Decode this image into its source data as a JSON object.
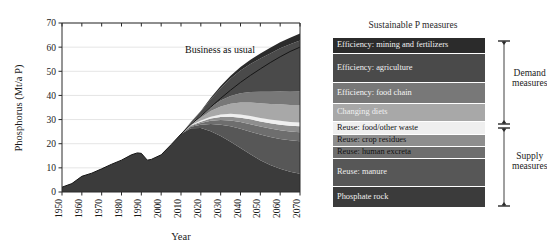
{
  "chart_data": {
    "type": "area",
    "title": "",
    "xlabel": "Year",
    "ylabel": "Phosphorus (Mt/a P)",
    "xlim": [
      1950,
      2070
    ],
    "ylim": [
      0,
      70
    ],
    "xticks": [
      1950,
      1960,
      1970,
      1980,
      1990,
      2000,
      2010,
      2020,
      2030,
      2040,
      2050,
      2060,
      2070
    ],
    "yticks": [
      0,
      10,
      20,
      30,
      40,
      50,
      60,
      70
    ],
    "grid": true,
    "legend_position": "right",
    "annotations": [
      {
        "text": "Business as usual",
        "x": 2022,
        "y": 52
      }
    ],
    "x": [
      1950,
      1955,
      1960,
      1965,
      1970,
      1975,
      1980,
      1985,
      1988,
      1990,
      1993,
      1995,
      2000,
      2005,
      2010,
      2015,
      2020,
      2025,
      2030,
      2035,
      2040,
      2045,
      2050,
      2055,
      2060,
      2065,
      2070
    ],
    "total_business_as_usual": [
      2.0,
      3.5,
      6.5,
      7.8,
      9.6,
      11.5,
      13.2,
      15.4,
      16.2,
      16.0,
      13.2,
      13.5,
      15.4,
      19.6,
      24.0,
      28.0,
      31.5,
      35.2,
      38.8,
      42.2,
      45.4,
      48.3,
      51.0,
      53.6,
      56.0,
      58.2,
      60.0
    ],
    "series": [
      {
        "name": "Phosphate rock",
        "color": "#3b3b3b",
        "values": [
          2.0,
          3.5,
          6.5,
          7.8,
          9.6,
          11.5,
          13.2,
          15.4,
          16.2,
          16.0,
          13.2,
          13.5,
          15.4,
          19.6,
          24.0,
          26.4,
          26.5,
          25.2,
          23.2,
          20.8,
          18.2,
          15.6,
          13.2,
          11.2,
          9.6,
          8.4,
          7.6
        ]
      },
      {
        "name": "Reuse: manure",
        "color": "#575757",
        "values": [
          0,
          0,
          0,
          0,
          0,
          0,
          0,
          0,
          0,
          0,
          0,
          0,
          0,
          0,
          0,
          0.6,
          1.4,
          3.0,
          4.7,
          6.4,
          8.0,
          9.4,
          10.6,
          11.6,
          12.4,
          13.0,
          13.4
        ]
      },
      {
        "name": "Reuse: human excreta",
        "color": "#6e6e6e",
        "values": [
          0,
          0,
          0,
          0,
          0,
          0,
          0,
          0,
          0,
          0,
          0,
          0,
          0,
          0,
          0,
          0.3,
          0.7,
          1.3,
          1.9,
          2.4,
          2.8,
          3.1,
          3.3,
          3.5,
          3.6,
          3.7,
          3.8
        ]
      },
      {
        "name": "Reuse: crop residues",
        "color": "#8e8e8e",
        "values": [
          0,
          0,
          0,
          0,
          0,
          0,
          0,
          0,
          0,
          0,
          0,
          0,
          0,
          0,
          0,
          0.2,
          0.5,
          0.9,
          1.3,
          1.6,
          1.8,
          2.0,
          2.1,
          2.2,
          2.3,
          2.3,
          2.4
        ]
      },
      {
        "name": "Reuse: food/other waste",
        "color": "#efefef",
        "values": [
          0,
          0,
          0,
          0,
          0,
          0,
          0,
          0,
          0,
          0,
          0,
          0,
          0,
          0,
          0,
          0.2,
          0.5,
          0.8,
          1.0,
          1.2,
          1.3,
          1.4,
          1.5,
          1.5,
          1.6,
          1.6,
          1.6
        ]
      },
      {
        "name": "Changing diets",
        "color": "#a8a8a8",
        "values": [
          0,
          0,
          0,
          0,
          0,
          0,
          0,
          0,
          0,
          0,
          0,
          0,
          0,
          0,
          0,
          0.4,
          1.2,
          2.3,
          3.3,
          4.2,
          5.0,
          5.6,
          6.1,
          6.5,
          6.8,
          7.0,
          7.2
        ]
      },
      {
        "name": "Efficiency: food chain",
        "color": "#787878",
        "values": [
          0,
          0,
          0,
          0,
          0,
          0,
          0,
          0,
          0,
          0,
          0,
          0,
          0,
          0,
          0,
          0.3,
          0.9,
          1.7,
          2.5,
          3.2,
          3.8,
          4.3,
          4.7,
          5.0,
          5.3,
          5.5,
          5.6
        ]
      },
      {
        "name": "Efficiency: agriculture",
        "color": "#4a4a4a",
        "values": [
          0,
          0,
          0,
          0,
          0,
          0,
          0,
          0,
          0,
          0,
          0,
          0,
          0,
          0,
          0,
          0.5,
          1.6,
          3.2,
          5.1,
          7.2,
          9.4,
          11.6,
          13.8,
          15.9,
          17.9,
          19.7,
          21.2
        ]
      },
      {
        "name": "Efficiency: mining and fertilizers",
        "color": "#2b2b2b",
        "values": [
          0,
          0,
          0,
          0,
          0,
          0,
          0,
          0,
          0,
          0,
          0,
          0,
          0,
          0,
          0,
          0.1,
          0.3,
          0.6,
          0.9,
          1.2,
          1.5,
          1.8,
          2.1,
          2.3,
          2.5,
          2.7,
          2.8
        ]
      }
    ]
  },
  "legend": {
    "title": "Sustainable P measures",
    "bands": [
      {
        "label": "Efficiency: mining and fertilizers",
        "color": "#2b2b2b",
        "text_color": "#f2f2f2",
        "height": 15
      },
      {
        "label": "Efficiency: agriculture",
        "color": "#4a4a4a",
        "text_color": "#f2f2f2",
        "height": 28
      },
      {
        "label": "Efficiency: food chain",
        "color": "#787878",
        "text_color": "#f7f7f7",
        "height": 20
      },
      {
        "label": "Changing diets",
        "color": "#a8a8a8",
        "text_color": "#f0f0f0",
        "height": 17
      },
      {
        "label": "Reuse: food/other waste",
        "color": "#efefef",
        "text_color": "#111111",
        "height": 12
      },
      {
        "label": "Reuse: crop residues",
        "color": "#8e8e8e",
        "text_color": "#111111",
        "height": 11
      },
      {
        "label": "Reuse: human excreta",
        "color": "#6e6e6e",
        "text_color": "#111111",
        "height": 11
      },
      {
        "label": "Reuse: manure",
        "color": "#575757",
        "text_color": "#eeeeee",
        "height": 27
      },
      {
        "label": "Phosphate rock",
        "color": "#3b3b3b",
        "text_color": "#f0f0f0",
        "height": 20
      }
    ]
  },
  "brackets": [
    {
      "label_line1": "Demand",
      "label_line2": "measures"
    },
    {
      "label_line1": "Supply",
      "label_line2": "measures"
    }
  ],
  "colors": {
    "background": "#ffffff",
    "axis": "#2a2a2a",
    "grid": "#d9d9d9",
    "text": "#1a1a1a"
  }
}
